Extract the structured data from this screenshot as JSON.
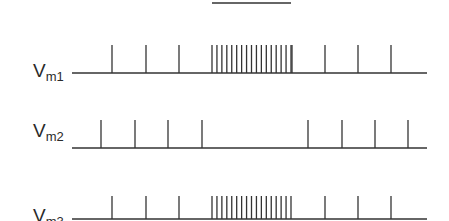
{
  "diagram": {
    "stimulus_bar": {
      "x_start": 212,
      "x_end": 291,
      "y": 3
    },
    "traces": [
      {
        "label_main": "V",
        "label_sub": "m1",
        "label_x": 33,
        "label_y": 61,
        "baseline_y": 73,
        "baseline_x_start": 72,
        "baseline_x_end": 427,
        "spike_top_y": 45,
        "sparse_spikes": [
          112,
          146,
          179,
          292,
          325,
          358,
          391
        ],
        "burst": {
          "start": 212,
          "end": 291,
          "count": 17
        },
        "pre_burst_step": true
      },
      {
        "label_main": "V",
        "label_sub": "m2",
        "label_x": 33,
        "label_y": 121,
        "baseline_y": 148,
        "baseline_x_start": 72,
        "baseline_x_end": 427,
        "spike_top_y": 120,
        "sparse_spikes": [
          101,
          135,
          168,
          202,
          308,
          342,
          375,
          408
        ],
        "burst": null
      },
      {
        "label_main": "V",
        "label_sub": "m3",
        "label_x": 33,
        "label_y": 206,
        "baseline_y": 223,
        "baseline_x_start": 72,
        "baseline_x_end": 427,
        "spike_top_y": 196,
        "sparse_spikes": [
          112,
          146,
          179,
          325,
          358,
          391
        ],
        "burst": {
          "start": 212,
          "end": 291,
          "count": 17
        }
      }
    ],
    "stroke_color": "#333333"
  }
}
